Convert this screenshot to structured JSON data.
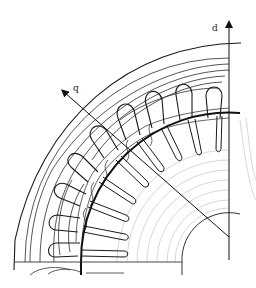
{
  "figure": {
    "type": "flux-line plot, quarter cross-section of electric machine",
    "axes": {
      "d_label": "d",
      "q_label": "q"
    },
    "geometry": {
      "center": [
        229,
        262
      ],
      "outer_stator_radius": 216,
      "airgap_radius": 148,
      "shaft_radius": 47,
      "stator_slot_count_visible": 8,
      "rotor_slot_count_visible": 10
    },
    "colors": {
      "line": "#1a1a1a",
      "faint_flux": "#bdbdbd",
      "background": "#ffffff"
    }
  }
}
